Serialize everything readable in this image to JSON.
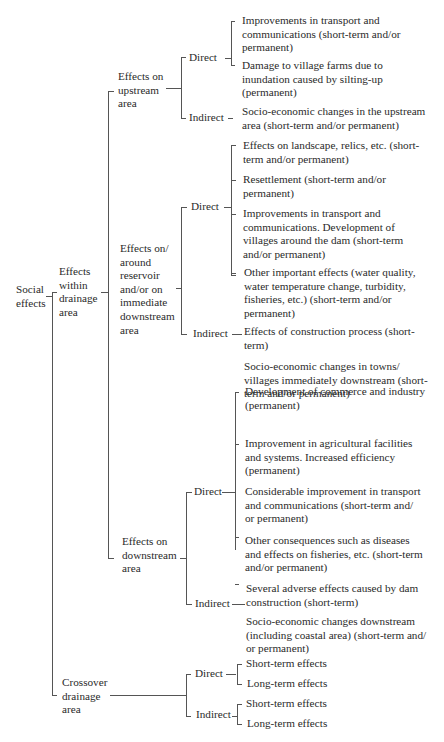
{
  "diagram": {
    "type": "tree",
    "root": "Social effects",
    "nodes": {
      "root": {
        "label": "Social\neffects"
      },
      "within": {
        "label": "Effects\nwithin\ndrainage\narea"
      },
      "crossover": {
        "label": "Crossover\ndrainage\narea"
      },
      "upstream": {
        "label": "Effects on\nupstream\narea"
      },
      "reservoir": {
        "label": "Effects on/\naround\nreservoir\nand/or on\nimmediate\ndownstream\narea"
      },
      "downstream": {
        "label": "Effects on\ndownstream\narea"
      },
      "up_direct": {
        "label": "Direct"
      },
      "up_indirect": {
        "label": "Indirect"
      },
      "res_direct": {
        "label": "Direct"
      },
      "res_indirect": {
        "label": "Indirect"
      },
      "down_direct": {
        "label": "Direct"
      },
      "down_indirect": {
        "label": "Indirect"
      },
      "cross_direct": {
        "label": "Direct"
      },
      "cross_indirect": {
        "label": "Indirect"
      }
    },
    "leaves": {
      "up_direct": [
        "Improvements in transport and\ncommunications (short-term and/or\npermanent)",
        "Damage to village farms due to\ninundation caused by silting-up\n(permanent)"
      ],
      "up_indirect": [
        "Socio-economic changes in the upstream\narea (short-term and/or permanent)"
      ],
      "res_direct": [
        "Effects on landscape, relics, etc. (short-\nterm and/or permanent)",
        "Resettlement (short-term and/or\npermanent)",
        "Improvements in transport and\ncommunications. Development of\nvillages around the dam (short-term\nand/or permanent)",
        "Other important effects (water quality,\nwater temperature change, turbidity,\nfisheries, etc.) (short-term and/or\npermanent)",
        "Effects of construction process (short-\nterm)"
      ],
      "res_indirect": [
        "Socio-economic changes in towns/\nvillages immediately downstream (short-\nterm and/or permanent)"
      ],
      "down_direct": [
        "Development of commerce and industry\n(permanent)",
        "Improvement in agricultural facilities\nand systems. Increased efficiency\n(permanent)",
        "Considerable improvement in transport\nand communications (short-term and/\nor permanent)",
        "Other consequences such as diseases\nand effects on fisheries, etc. (short-term\nand/or permanent)",
        "Several adverse effects caused by dam\nconstruction (short-term)"
      ],
      "down_indirect": [
        "Socio-economic changes downstream\n(including coastal area) (short-term and/\nor permanent)"
      ],
      "cross_direct": [
        "Short-term effects",
        "Long-term effects"
      ],
      "cross_indirect": [
        "Short-term effects",
        "Long-term effects"
      ]
    }
  }
}
